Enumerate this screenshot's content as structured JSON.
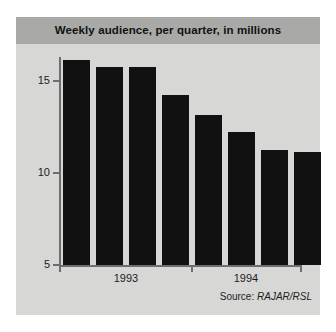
{
  "chart_data": {
    "type": "bar",
    "title": "Weekly audience, per quarter, in millions",
    "xlabel": "",
    "ylabel": "",
    "ylim": [
      5,
      17
    ],
    "yticks": [
      5,
      10,
      15
    ],
    "ytick_labels": [
      "5",
      "10",
      "15"
    ],
    "grid": false,
    "legend": null,
    "categories": [
      "1993 Q1",
      "1993 Q2",
      "1993 Q3",
      "1993 Q4",
      "1994 Q1",
      "1994 Q2",
      "1994 Q3",
      "1994 Q4"
    ],
    "values": [
      16.1,
      15.7,
      15.7,
      14.2,
      13.1,
      12.2,
      11.2,
      11.1
    ],
    "group_labels": [
      "1993",
      "1994"
    ],
    "bar_color": "#111111",
    "source": "Source: RAJAR/RSL",
    "source_prefix": "Source: ",
    "source_value": "RAJAR/RSL"
  },
  "title_band": {
    "text": "Weekly audience, per quarter, in millions",
    "background": "#a9a9a7"
  },
  "axes": {
    "y_labels": [
      "15",
      "10",
      "5"
    ],
    "x_group_labels": [
      "1993",
      "1994"
    ],
    "axis_color": "#6e6e6c"
  },
  "plate": {
    "background": "#d5d5d3"
  },
  "source": {
    "prefix": "Source: ",
    "value": "RAJAR/RSL"
  }
}
